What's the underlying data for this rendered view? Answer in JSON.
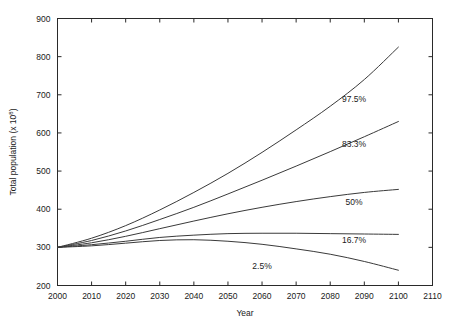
{
  "chart_data": {
    "type": "line",
    "title": "",
    "xlabel": "Year",
    "ylabel": "Total population (x 10",
    "ylabel_exponent": "8",
    "ylabel_suffix": ")",
    "xlim": [
      2000,
      2110
    ],
    "ylim": [
      200,
      900
    ],
    "xticks": [
      2000,
      2010,
      2020,
      2030,
      2040,
      2050,
      2060,
      2070,
      2080,
      2090,
      2100,
      2110
    ],
    "yticks": [
      200,
      300,
      400,
      500,
      600,
      700,
      800,
      900
    ],
    "xtick_labels": [
      "2000",
      "2010",
      "2020",
      "2030",
      "2040",
      "2050",
      "2060",
      "2070",
      "2080",
      "2090",
      "2100",
      "2110"
    ],
    "ytick_labels": [
      "200",
      "300",
      "400",
      "500",
      "600",
      "700",
      "800",
      "900"
    ],
    "grid": false,
    "legend": "inline-end-labels",
    "x": [
      2000,
      2010,
      2020,
      2030,
      2040,
      2050,
      2060,
      2070,
      2080,
      2090,
      2100
    ],
    "series": [
      {
        "name": "97.5%",
        "label": "97.5%",
        "label_x": 2087,
        "label_y": 688,
        "values": [
          300,
          324,
          357,
          398,
          444,
          494,
          549,
          608,
          670,
          740,
          825
        ]
      },
      {
        "name": "83.3%",
        "label": "83.3%",
        "label_x": 2087,
        "label_y": 572,
        "values": [
          300,
          318,
          343,
          373,
          405,
          440,
          476,
          513,
          551,
          590,
          630
        ]
      },
      {
        "name": "50%",
        "label": "50%",
        "label_x": 2087,
        "label_y": 418,
        "values": [
          300,
          312,
          329,
          349,
          369,
          388,
          405,
          420,
          433,
          444,
          452
        ]
      },
      {
        "name": "16.7%",
        "label": "16.7%",
        "label_x": 2087,
        "label_y": 318,
        "values": [
          300,
          307,
          316,
          326,
          332,
          336,
          337,
          337,
          336,
          335,
          334
        ]
      },
      {
        "name": "2.5%",
        "label": "2.5%",
        "label_x": 2060,
        "label_y": 250,
        "values": [
          300,
          304,
          311,
          318,
          320,
          316,
          308,
          296,
          282,
          263,
          240
        ]
      }
    ]
  },
  "axes": {
    "x_title": "Year",
    "y_title_main": "Total population (x 10",
    "y_title_exp": "8",
    "y_title_close": ")"
  }
}
